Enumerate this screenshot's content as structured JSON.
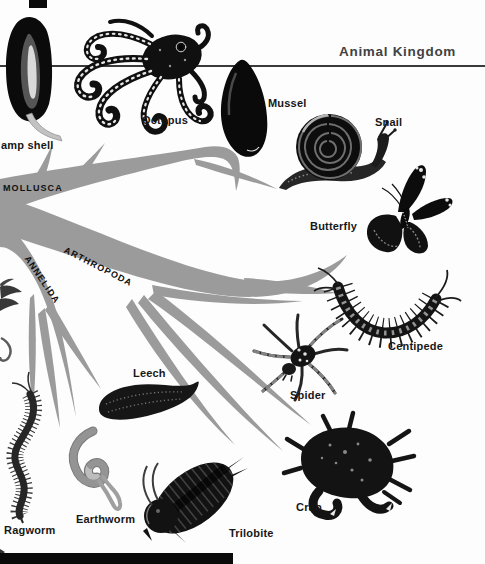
{
  "header": {
    "title": "Animal Kingdom"
  },
  "branches": [
    {
      "id": "mollusca",
      "label": "MOLLUSCA"
    },
    {
      "id": "arthropoda",
      "label": "ARTHROPODA"
    },
    {
      "id": "annelida",
      "label": "ANNELIDA"
    }
  ],
  "specimens": [
    {
      "name": "lamp-shell",
      "label": "amp shell"
    },
    {
      "name": "octopus",
      "label": "Octopus"
    },
    {
      "name": "mussel",
      "label": "Mussel"
    },
    {
      "name": "snail",
      "label": "Snail"
    },
    {
      "name": "butterfly",
      "label": "Butterfly"
    },
    {
      "name": "centipede",
      "label": "Centipede"
    },
    {
      "name": "spider",
      "label": "Spider"
    },
    {
      "name": "leech",
      "label": "Leech"
    },
    {
      "name": "ragworm",
      "label": "Ragworm"
    },
    {
      "name": "earthworm",
      "label": "Earthworm"
    },
    {
      "name": "trilobite",
      "label": "Trilobite"
    },
    {
      "name": "crab",
      "label": "Crab"
    }
  ],
  "colors": {
    "branch": "#9b9b9b",
    "label_ink": "#171717",
    "header_ink": "#424242",
    "rule": "#3a3a3a",
    "illustration_ink": "#101010"
  }
}
